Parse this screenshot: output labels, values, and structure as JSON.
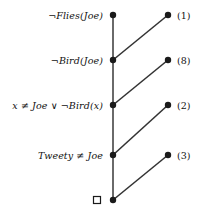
{
  "figure": {
    "width": 207,
    "height": 218,
    "background": "#ffffff",
    "spine_color": "#6a6a6a",
    "edge_color": "#333333",
    "node_color": "#1a1a1a",
    "text_color": "#111111"
  },
  "spine_nodes": [
    {
      "id": "n1",
      "label": "¬Flies(Joe)",
      "x": 113,
      "y": 15
    },
    {
      "id": "n2",
      "label": "¬Bird(Joe)",
      "x": 113,
      "y": 60
    },
    {
      "id": "n3",
      "label": "x ≠ Joe ∨ ¬Bird(x)",
      "x": 113,
      "y": 105
    },
    {
      "id": "n4",
      "label": "Tweety ≠ Joe",
      "x": 113,
      "y": 155
    },
    {
      "id": "n5",
      "label": "□",
      "x": 113,
      "y": 200
    }
  ],
  "input_nodes": [
    {
      "id": "i1",
      "label": "(1)",
      "x": 168,
      "y": 15
    },
    {
      "id": "i2",
      "label": "(8)",
      "x": 168,
      "y": 60
    },
    {
      "id": "i3",
      "label": "(2)",
      "x": 168,
      "y": 105
    },
    {
      "id": "i4",
      "label": "(3)",
      "x": 168,
      "y": 155
    }
  ],
  "spine_edges": [
    {
      "from": "n1",
      "to": "n2"
    },
    {
      "from": "n2",
      "to": "n3"
    },
    {
      "from": "n3",
      "to": "n4"
    },
    {
      "from": "n4",
      "to": "n5"
    }
  ],
  "resolution_edges": [
    {
      "from": "i1",
      "to": "n2"
    },
    {
      "from": "i2",
      "to": "n3"
    },
    {
      "from": "i3",
      "to": "n4"
    },
    {
      "from": "i4",
      "to": "n5"
    }
  ],
  "empty_clause": {
    "symbol": "□",
    "x": 97,
    "y": 200,
    "size": 7
  }
}
